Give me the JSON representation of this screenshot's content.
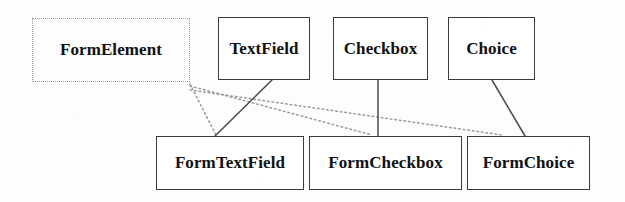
{
  "diagram": {
    "type": "class-inheritance-diagram",
    "background_color": "#fdfdfd",
    "nodes": [
      {
        "id": "form-element",
        "label": "FormElement",
        "border_style": "dotted",
        "border_color": "#9a9a9a",
        "x": 32,
        "y": 18,
        "width": 158,
        "height": 64
      },
      {
        "id": "text-field",
        "label": "TextField",
        "border_style": "solid",
        "border_color": "#3b3b3b",
        "x": 218,
        "y": 17,
        "width": 92,
        "height": 63
      },
      {
        "id": "checkbox",
        "label": "Checkbox",
        "border_style": "solid",
        "border_color": "#3b3b3b",
        "x": 333,
        "y": 17,
        "width": 95,
        "height": 63
      },
      {
        "id": "choice",
        "label": "Choice",
        "border_style": "solid",
        "border_color": "#3b3b3b",
        "x": 448,
        "y": 17,
        "width": 87,
        "height": 63
      },
      {
        "id": "form-text-field",
        "label": "FormTextField",
        "border_style": "solid",
        "border_color": "#3b3b3b",
        "x": 156,
        "y": 136,
        "width": 148,
        "height": 54
      },
      {
        "id": "form-checkbox",
        "label": "FormCheckbox",
        "border_style": "solid",
        "border_color": "#3b3b3b",
        "x": 309,
        "y": 136,
        "width": 153,
        "height": 54
      },
      {
        "id": "form-choice",
        "label": "FormChoice",
        "border_style": "solid",
        "border_color": "#3b3b3b",
        "x": 467,
        "y": 136,
        "width": 123,
        "height": 54
      }
    ],
    "edges": [
      {
        "id": "edge-textfield-formtextfield",
        "from": "text-field",
        "to": "form-text-field",
        "style": "solid",
        "color": "#4a4a4a",
        "x1": 272,
        "y1": 80,
        "x2": 215,
        "y2": 136
      },
      {
        "id": "edge-checkbox-formcheckbox",
        "from": "checkbox",
        "to": "form-checkbox",
        "style": "solid",
        "color": "#4a4a4a",
        "x1": 378,
        "y1": 80,
        "x2": 378,
        "y2": 136
      },
      {
        "id": "edge-choice-formchoice",
        "from": "choice",
        "to": "form-choice",
        "style": "solid",
        "color": "#4a4a4a",
        "x1": 492,
        "y1": 80,
        "x2": 525,
        "y2": 136
      },
      {
        "id": "edge-formelement-formtextfield",
        "from": "form-element",
        "to": "form-text-field",
        "style": "dotted",
        "color": "#9a9a9a",
        "x1": 190,
        "y1": 84,
        "x2": 216,
        "y2": 135
      },
      {
        "id": "edge-formelement-formcheckbox",
        "from": "form-element",
        "to": "form-checkbox",
        "style": "dotted",
        "color": "#9a9a9a",
        "x1": 190,
        "y1": 86,
        "x2": 372,
        "y2": 135
      },
      {
        "id": "edge-formelement-formchoice",
        "from": "form-element",
        "to": "form-choice",
        "style": "dotted",
        "color": "#9a9a9a",
        "x1": 190,
        "y1": 90,
        "x2": 502,
        "y2": 135
      }
    ]
  }
}
